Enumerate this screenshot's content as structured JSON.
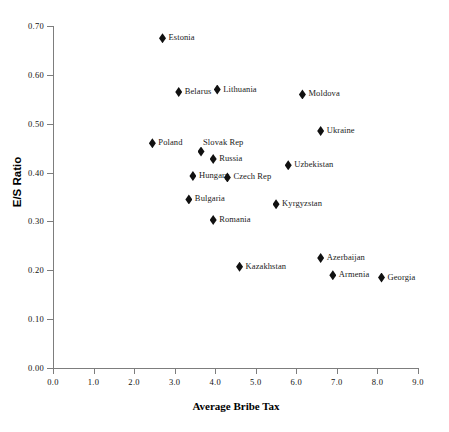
{
  "chart_data": {
    "type": "scatter",
    "title": "",
    "xlabel": "Average Bribe Tax",
    "ylabel": "E/S Ratio",
    "xlim": [
      0.0,
      9.0
    ],
    "ylim": [
      0.0,
      0.7
    ],
    "xticks": [
      "0.0",
      "1.0",
      "2.0",
      "3.0",
      "4.0",
      "5.0",
      "6.0",
      "7.0",
      "8.0",
      "9.0"
    ],
    "yticks": [
      "0.00",
      "0.10",
      "0.20",
      "0.30",
      "0.40",
      "0.50",
      "0.60",
      "0.70"
    ],
    "grid": false,
    "legend": "none",
    "marker": "diamond",
    "marker_color": "#111111",
    "points": [
      {
        "label": "Estonia",
        "x": 2.7,
        "y": 0.675,
        "label_pos": "right"
      },
      {
        "label": "Belarus",
        "x": 3.1,
        "y": 0.565,
        "label_pos": "right"
      },
      {
        "label": "Lithuania",
        "x": 4.05,
        "y": 0.57,
        "label_pos": "right"
      },
      {
        "label": "Moldova",
        "x": 6.15,
        "y": 0.56,
        "label_pos": "right"
      },
      {
        "label": "Ukraine",
        "x": 6.6,
        "y": 0.485,
        "label_pos": "right"
      },
      {
        "label": "Poland",
        "x": 2.45,
        "y": 0.46,
        "label_pos": "right"
      },
      {
        "label": "Slovak Rep",
        "x": 3.65,
        "y": 0.443,
        "label_pos": "above"
      },
      {
        "label": "Russia",
        "x": 3.95,
        "y": 0.428,
        "label_pos": "right"
      },
      {
        "label": "Uzbekistan",
        "x": 5.8,
        "y": 0.415,
        "label_pos": "right"
      },
      {
        "label": "Hungary",
        "x": 3.45,
        "y": 0.393,
        "label_pos": "right"
      },
      {
        "label": "Czech Rep",
        "x": 4.3,
        "y": 0.39,
        "label_pos": "right"
      },
      {
        "label": "Bulgaria",
        "x": 3.35,
        "y": 0.345,
        "label_pos": "right"
      },
      {
        "label": "Kyrgyzstan",
        "x": 5.5,
        "y": 0.335,
        "label_pos": "right"
      },
      {
        "label": "Romania",
        "x": 3.95,
        "y": 0.303,
        "label_pos": "right"
      },
      {
        "label": "Azerbaijan",
        "x": 6.6,
        "y": 0.225,
        "label_pos": "right"
      },
      {
        "label": "Kazakhstan",
        "x": 4.6,
        "y": 0.207,
        "label_pos": "right"
      },
      {
        "label": "Armenia",
        "x": 6.9,
        "y": 0.19,
        "label_pos": "right"
      },
      {
        "label": "Georgia",
        "x": 8.1,
        "y": 0.185,
        "label_pos": "right"
      }
    ]
  }
}
